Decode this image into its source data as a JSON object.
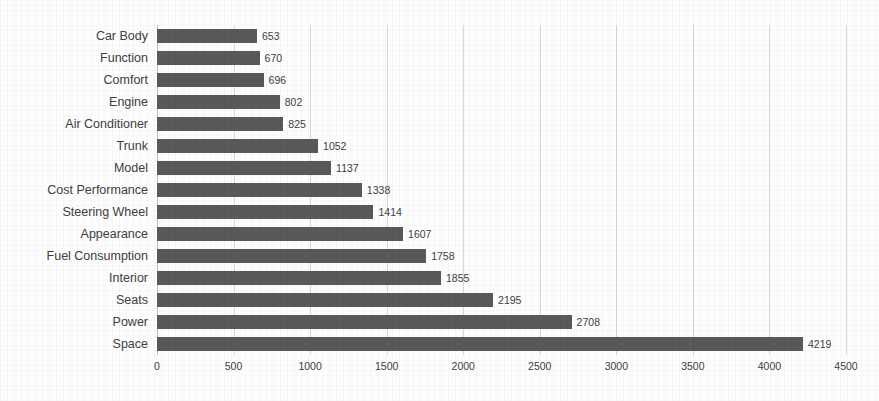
{
  "chart_data": {
    "type": "bar",
    "orientation": "horizontal",
    "title": "",
    "subtitle": "",
    "xlabel": "",
    "ylabel": "",
    "xlim": [
      0,
      4500
    ],
    "xticks": [
      0,
      500,
      1000,
      1500,
      2000,
      2500,
      3000,
      3500,
      4000,
      4500
    ],
    "xtick_labels": [
      "0",
      "500",
      "1000",
      "1500",
      "2000",
      "2500",
      "3000",
      "3500",
      "4000",
      "4500"
    ],
    "grid": "vertical",
    "legend": "none",
    "data_labels": true,
    "bar_color": "#595959",
    "gridline_color": "#d9d9d9",
    "axis_color": "#bfbfbf",
    "background_color": "#ffffff",
    "categories": [
      "Car Body",
      "Function",
      "Comfort",
      "Engine",
      "Air Conditioner",
      "Trunk",
      "Model",
      "Cost Performance",
      "Steering Wheel",
      "Appearance",
      "Fuel Consumption",
      "Interior",
      "Seats",
      "Power",
      "Space"
    ],
    "values": [
      653,
      670,
      696,
      802,
      825,
      1052,
      1137,
      1338,
      1414,
      1607,
      1758,
      1855,
      2195,
      2708,
      4219
    ],
    "value_labels": [
      "653",
      "670",
      "696",
      "802",
      "825",
      "1052",
      "1137",
      "1338",
      "1414",
      "1607",
      "1758",
      "1855",
      "2195",
      "2708",
      "4219"
    ]
  }
}
